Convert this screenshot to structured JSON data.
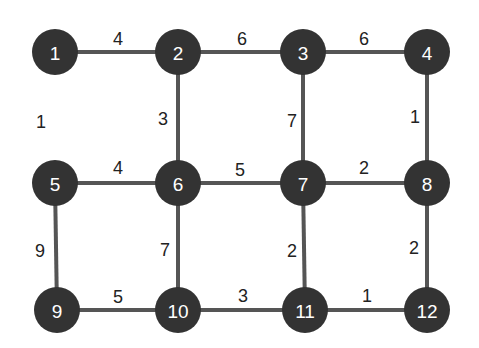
{
  "graph": {
    "title": "",
    "nodes": [
      {
        "id": "1",
        "label": "1",
        "x": 55,
        "y": 52
      },
      {
        "id": "2",
        "label": "2",
        "x": 178,
        "y": 52
      },
      {
        "id": "3",
        "label": "3",
        "x": 303,
        "y": 52
      },
      {
        "id": "4",
        "label": "4",
        "x": 427,
        "y": 52
      },
      {
        "id": "5",
        "label": "5",
        "x": 55,
        "y": 183
      },
      {
        "id": "6",
        "label": "6",
        "x": 178,
        "y": 183
      },
      {
        "id": "7",
        "label": "7",
        "x": 303,
        "y": 183
      },
      {
        "id": "8",
        "label": "8",
        "x": 427,
        "y": 183
      },
      {
        "id": "9",
        "label": "9",
        "x": 57,
        "y": 310
      },
      {
        "id": "10",
        "label": "10",
        "x": 178,
        "y": 310
      },
      {
        "id": "11",
        "label": "11",
        "x": 305,
        "y": 310
      },
      {
        "id": "12",
        "label": "12",
        "x": 427,
        "y": 310
      }
    ],
    "edges": [
      {
        "from": "1",
        "to": "2",
        "weight": "4",
        "drawn": true,
        "label_x": 118,
        "label_y": 39
      },
      {
        "from": "2",
        "to": "3",
        "weight": "6",
        "drawn": true,
        "label_x": 242,
        "label_y": 39
      },
      {
        "from": "3",
        "to": "4",
        "weight": "6",
        "drawn": true,
        "label_x": 364,
        "label_y": 39
      },
      {
        "from": "1",
        "to": "5",
        "weight": "1",
        "drawn": false,
        "label_x": 41,
        "label_y": 122
      },
      {
        "from": "2",
        "to": "6",
        "weight": "3",
        "drawn": true,
        "label_x": 163,
        "label_y": 119
      },
      {
        "from": "3",
        "to": "7",
        "weight": "7",
        "drawn": true,
        "label_x": 292,
        "label_y": 121
      },
      {
        "from": "4",
        "to": "8",
        "weight": "1",
        "drawn": true,
        "label_x": 415,
        "label_y": 117
      },
      {
        "from": "5",
        "to": "6",
        "weight": "4",
        "drawn": true,
        "label_x": 118,
        "label_y": 168
      },
      {
        "from": "6",
        "to": "7",
        "weight": "5",
        "drawn": true,
        "label_x": 240,
        "label_y": 170
      },
      {
        "from": "7",
        "to": "8",
        "weight": "2",
        "drawn": true,
        "label_x": 364,
        "label_y": 168
      },
      {
        "from": "5",
        "to": "9",
        "weight": "9",
        "drawn": true,
        "label_x": 40,
        "label_y": 251
      },
      {
        "from": "6",
        "to": "10",
        "weight": "7",
        "drawn": true,
        "label_x": 165,
        "label_y": 250
      },
      {
        "from": "7",
        "to": "11",
        "weight": "2",
        "drawn": true,
        "label_x": 292,
        "label_y": 251
      },
      {
        "from": "8",
        "to": "12",
        "weight": "2",
        "drawn": true,
        "label_x": 414,
        "label_y": 248
      },
      {
        "from": "9",
        "to": "10",
        "weight": "5",
        "drawn": true,
        "label_x": 118,
        "label_y": 297
      },
      {
        "from": "10",
        "to": "11",
        "weight": "3",
        "drawn": true,
        "label_x": 243,
        "label_y": 296
      },
      {
        "from": "11",
        "to": "12",
        "weight": "1",
        "drawn": true,
        "label_x": 367,
        "label_y": 296
      }
    ]
  },
  "style": {
    "node_fill": "#333333",
    "node_text": "#ffffff",
    "edge_color": "#555555",
    "weight_color": "#222222",
    "background": "#ffffff"
  }
}
